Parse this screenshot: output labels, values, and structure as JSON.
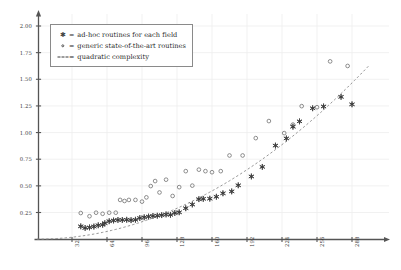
{
  "chart_data": {
    "type": "scatter",
    "title": "",
    "xlabel": "",
    "ylabel": "",
    "xlim": [
      0,
      304
    ],
    "ylim": [
      0,
      2.1
    ],
    "grid": true,
    "legend_position": "top-left",
    "xticks": [
      32,
      64,
      96,
      128,
      160,
      192,
      224,
      256,
      288
    ],
    "xtick_labels": [
      "32",
      "64",
      "96",
      "128",
      "160",
      "192",
      "224",
      "256",
      "288"
    ],
    "yticks": [
      0.25,
      0.5,
      0.75,
      1.0,
      1.25,
      1.5,
      1.75,
      2.0
    ],
    "ytick_labels": [
      "0.25",
      "0.50",
      "0.75",
      "1.00",
      "1.25",
      "1.50",
      "1.75",
      "2.00"
    ],
    "series": [
      {
        "name": "ad-hoc routines for each field",
        "marker": "star",
        "color": "#3d3d3d",
        "points": [
          [
            40,
            0.12
          ],
          [
            44,
            0.105
          ],
          [
            48,
            0.11
          ],
          [
            52,
            0.118
          ],
          [
            56,
            0.13
          ],
          [
            60,
            0.135
          ],
          [
            62,
            0.15
          ],
          [
            66,
            0.168
          ],
          [
            70,
            0.175
          ],
          [
            74,
            0.18
          ],
          [
            78,
            0.18
          ],
          [
            82,
            0.182
          ],
          [
            86,
            0.178
          ],
          [
            90,
            0.182
          ],
          [
            94,
            0.198
          ],
          [
            98,
            0.205
          ],
          [
            102,
            0.212
          ],
          [
            106,
            0.218
          ],
          [
            110,
            0.22
          ],
          [
            114,
            0.225
          ],
          [
            118,
            0.232
          ],
          [
            122,
            0.228
          ],
          [
            126,
            0.245
          ],
          [
            130,
            0.252
          ],
          [
            136,
            0.29
          ],
          [
            142,
            0.325
          ],
          [
            148,
            0.375
          ],
          [
            152,
            0.378
          ],
          [
            158,
            0.38
          ],
          [
            164,
            0.398
          ],
          [
            170,
            0.43
          ],
          [
            178,
            0.448
          ],
          [
            184,
            0.505
          ],
          [
            196,
            0.588
          ],
          [
            206,
            0.678
          ],
          [
            218,
            0.878
          ],
          [
            228,
            0.945
          ],
          [
            234,
            1.055
          ],
          [
            240,
            1.105
          ],
          [
            252,
            1.228
          ],
          [
            262,
            1.245
          ],
          [
            278,
            1.335
          ],
          [
            288,
            1.265
          ]
        ]
      },
      {
        "name": "generic state-of-the-art routines",
        "marker": "circle",
        "color": "#6a6a6a",
        "points": [
          [
            40,
            0.245
          ],
          [
            48,
            0.215
          ],
          [
            54,
            0.248
          ],
          [
            60,
            0.238
          ],
          [
            66,
            0.248
          ],
          [
            72,
            0.248
          ],
          [
            76,
            0.368
          ],
          [
            80,
            0.358
          ],
          [
            84,
            0.368
          ],
          [
            90,
            0.368
          ],
          [
            96,
            0.352
          ],
          [
            100,
            0.392
          ],
          [
            104,
            0.498
          ],
          [
            108,
            0.545
          ],
          [
            112,
            0.438
          ],
          [
            118,
            0.558
          ],
          [
            124,
            0.405
          ],
          [
            130,
            0.488
          ],
          [
            136,
            0.638
          ],
          [
            142,
            0.502
          ],
          [
            148,
            0.652
          ],
          [
            154,
            0.638
          ],
          [
            160,
            0.628
          ],
          [
            168,
            0.638
          ],
          [
            176,
            0.785
          ],
          [
            188,
            0.785
          ],
          [
            200,
            0.948
          ],
          [
            212,
            1.108
          ],
          [
            226,
            0.995
          ],
          [
            234,
            1.075
          ],
          [
            242,
            1.248
          ],
          [
            256,
            1.238
          ],
          [
            268,
            1.668
          ],
          [
            284,
            1.625
          ]
        ]
      }
    ],
    "reference_curve": {
      "name": "quadratic complexity",
      "style": "dashed",
      "color": "#8a8a8a",
      "formula_points": [
        [
          0,
          0.0
        ],
        [
          32,
          0.018
        ],
        [
          64,
          0.072
        ],
        [
          96,
          0.163
        ],
        [
          128,
          0.29
        ],
        [
          160,
          0.452
        ],
        [
          192,
          0.652
        ],
        [
          224,
          0.887
        ],
        [
          256,
          1.158
        ],
        [
          288,
          1.466
        ],
        [
          304,
          1.633
        ]
      ]
    }
  },
  "legend": {
    "equals": "=",
    "rows": [
      {
        "key": "star-marker",
        "label": "ad-hoc routines for each field"
      },
      {
        "key": "circle-marker",
        "label": "generic state-of-the-art routines"
      },
      {
        "key": "dashed-line",
        "label": "quadratic complexity"
      }
    ]
  }
}
